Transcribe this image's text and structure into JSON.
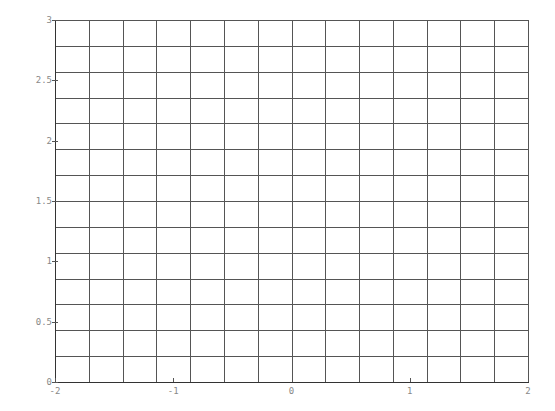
{
  "chart_data": {
    "type": "line",
    "title": "",
    "xlabel": "",
    "ylabel": "",
    "xlim": [
      -2,
      2
    ],
    "ylim": [
      0,
      3
    ],
    "x_ticks": [
      -2,
      -1,
      0,
      1,
      2
    ],
    "x_tick_labels": [
      "-2",
      "-1",
      "0",
      "1",
      "2"
    ],
    "y_ticks": [
      0,
      0.5,
      1,
      1.5,
      2,
      2.5,
      3
    ],
    "y_tick_labels": [
      "0",
      "0.5",
      "1",
      "1.5",
      "2",
      "2.5",
      "3"
    ],
    "grid": true,
    "grid_divisions_x": 14,
    "grid_divisions_y": 14,
    "series": [],
    "colors": {
      "grid": "#555555",
      "tick_label": "#888888",
      "axis": "#333333"
    }
  }
}
